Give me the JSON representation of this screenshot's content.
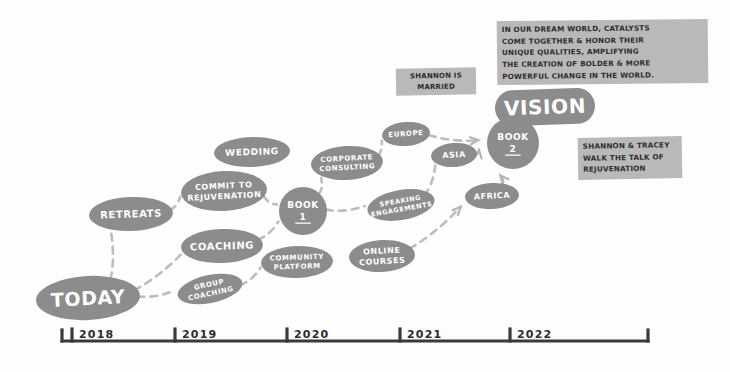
{
  "diagram": {
    "colors": {
      "node_fill": "#8c8c8c",
      "node_text": "#ffffff",
      "link": "#bdbdbd",
      "note_background": "#b9b9b9",
      "note_text": "#2e2e2e",
      "axis": "#3a3a3a",
      "background": "#fefefe"
    },
    "nodes": [
      {
        "id": "today",
        "label": "TODAY",
        "sublabel": "",
        "shape": "ellipse",
        "cx": 88,
        "cy": 298,
        "rx": 52,
        "ry": 22,
        "rotate": -3,
        "font_size": 19,
        "emphasis": "large"
      },
      {
        "id": "retreats",
        "label": "RETREATS",
        "sublabel": "",
        "shape": "ellipse",
        "cx": 131,
        "cy": 214,
        "rx": 42,
        "ry": 17,
        "rotate": -2,
        "font_size": 10,
        "emphasis": "normal"
      },
      {
        "id": "commit",
        "label": "COMMIT TO",
        "sublabel": "REJUVENATION",
        "shape": "ellipse",
        "cx": 224,
        "cy": 191,
        "rx": 43,
        "ry": 20,
        "rotate": -3,
        "font_size": 8,
        "emphasis": "normal"
      },
      {
        "id": "wedding",
        "label": "WEDDING",
        "sublabel": "",
        "shape": "ellipse",
        "cx": 252,
        "cy": 152,
        "rx": 38,
        "ry": 15,
        "rotate": -2,
        "font_size": 9,
        "emphasis": "normal"
      },
      {
        "id": "coaching",
        "label": "COACHING",
        "sublabel": "",
        "shape": "ellipse",
        "cx": 222,
        "cy": 246,
        "rx": 41,
        "ry": 17,
        "rotate": -2,
        "font_size": 10,
        "emphasis": "normal"
      },
      {
        "id": "group",
        "label": "GROUP",
        "sublabel": "COACHING",
        "shape": "ellipse",
        "cx": 210,
        "cy": 289,
        "rx": 33,
        "ry": 14,
        "rotate": -12,
        "font_size": 7,
        "emphasis": "small"
      },
      {
        "id": "book1",
        "label": "BOOK",
        "sublabel": "1",
        "shape": "circle",
        "cx": 303,
        "cy": 211,
        "rx": 24,
        "ry": 24,
        "rotate": 0,
        "font_size": 9,
        "emphasis": "normal"
      },
      {
        "id": "community",
        "label": "COMMUNITY",
        "sublabel": "PLATFORM",
        "shape": "ellipse",
        "cx": 297,
        "cy": 262,
        "rx": 36,
        "ry": 16,
        "rotate": -2,
        "font_size": 7,
        "emphasis": "small"
      },
      {
        "id": "online",
        "label": "ONLINE",
        "sublabel": "COURSES",
        "shape": "ellipse",
        "cx": 382,
        "cy": 256,
        "rx": 33,
        "ry": 16,
        "rotate": -3,
        "font_size": 8,
        "emphasis": "small"
      },
      {
        "id": "corporate",
        "label": "CORPORATE",
        "sublabel": "CONSULTING",
        "shape": "ellipse",
        "cx": 347,
        "cy": 163,
        "rx": 36,
        "ry": 17,
        "rotate": -3,
        "font_size": 7,
        "emphasis": "small"
      },
      {
        "id": "speaking",
        "label": "SPEAKING",
        "sublabel": "ENGAGEMENTS",
        "shape": "ellipse",
        "cx": 401,
        "cy": 205,
        "rx": 34,
        "ry": 15,
        "rotate": -10,
        "font_size": 6.5,
        "emphasis": "small"
      },
      {
        "id": "europe",
        "label": "EUROPE",
        "sublabel": "",
        "shape": "ellipse",
        "cx": 406,
        "cy": 134,
        "rx": 24,
        "ry": 12,
        "rotate": -4,
        "font_size": 7,
        "emphasis": "small"
      },
      {
        "id": "asia",
        "label": "ASIA",
        "sublabel": "",
        "shape": "ellipse",
        "cx": 454,
        "cy": 155,
        "rx": 23,
        "ry": 12,
        "rotate": -4,
        "font_size": 8,
        "emphasis": "small"
      },
      {
        "id": "africa",
        "label": "AFRICA",
        "sublabel": "",
        "shape": "ellipse",
        "cx": 492,
        "cy": 196,
        "rx": 27,
        "ry": 13,
        "rotate": -3,
        "font_size": 8,
        "emphasis": "small"
      },
      {
        "id": "book2",
        "label": "BOOK",
        "sublabel": "2",
        "shape": "circle",
        "cx": 513,
        "cy": 143,
        "rx": 26,
        "ry": 26,
        "rotate": 0,
        "font_size": 9,
        "emphasis": "normal"
      },
      {
        "id": "vision",
        "label": "VISION",
        "sublabel": "",
        "shape": "blob",
        "cx": 545,
        "cy": 107,
        "rx": 50,
        "ry": 18,
        "rotate": -2,
        "font_size": 20,
        "emphasis": "large"
      }
    ],
    "links": [
      {
        "from": "today",
        "to": "retreats",
        "arrow": false
      },
      {
        "from": "today",
        "to": "coaching",
        "arrow": false
      },
      {
        "from": "today",
        "to": "group",
        "arrow": false
      },
      {
        "from": "retreats",
        "to": "commit",
        "arrow": false
      },
      {
        "from": "commit",
        "to": "book1",
        "arrow": false
      },
      {
        "from": "coaching",
        "to": "book1",
        "arrow": false
      },
      {
        "from": "group",
        "to": "community",
        "arrow": false
      },
      {
        "from": "book1",
        "to": "corporate",
        "arrow": false
      },
      {
        "from": "book1",
        "to": "speaking",
        "arrow": false
      },
      {
        "from": "corporate",
        "to": "europe",
        "arrow": false
      },
      {
        "from": "speaking",
        "to": "asia",
        "arrow": false
      },
      {
        "from": "europe",
        "to": "book2",
        "arrow": true
      },
      {
        "from": "asia",
        "to": "book2",
        "arrow": true
      },
      {
        "from": "africa",
        "to": "book2",
        "arrow": true
      },
      {
        "from": "online",
        "to": "africa",
        "arrow": true
      }
    ],
    "notes": [
      {
        "id": "dream-world",
        "lines": [
          "IN OUR DREAM WORLD, CATALYSTS",
          "COME TOGETHER & HONOR THEIR",
          "UNIQUE QUALITIES, AMPLIFYING",
          "THE CREATION OF BOLDER & MORE",
          "POWERFUL CHANGE IN THE WORLD."
        ],
        "x": 497,
        "y": 20,
        "width": 211,
        "height": 64,
        "font_size": 7.2,
        "rotate": -0.6,
        "align": "left"
      },
      {
        "id": "shannon-married",
        "lines": [
          "SHANNON IS",
          "MARRIED"
        ],
        "x": 396,
        "y": 68,
        "width": 80,
        "height": 27,
        "font_size": 7,
        "rotate": -1,
        "align": "center"
      },
      {
        "id": "walk-the-talk",
        "lines": [
          "SHANNON & TRACEY",
          "WALK THE TALK OF",
          "REJUVENATION"
        ],
        "x": 578,
        "y": 137,
        "width": 104,
        "height": 42,
        "font_size": 7.2,
        "rotate": -1,
        "align": "left"
      }
    ],
    "axis": {
      "y": 341,
      "x_start": 62,
      "x_end": 648,
      "ticks": [
        {
          "label": "2018",
          "x": 72
        },
        {
          "label": "2019",
          "x": 175
        },
        {
          "label": "2020",
          "x": 287
        },
        {
          "label": "2021",
          "x": 400
        },
        {
          "label": "2022",
          "x": 510
        }
      ]
    }
  }
}
